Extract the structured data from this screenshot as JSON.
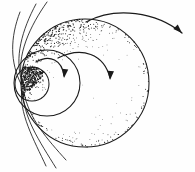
{
  "figure": {
    "title": "Nested stippled spheres with circulation arrows",
    "style": "pen-and-ink stipple drawing",
    "background_color": "#fefefe",
    "ink_color": "#1a1a1a",
    "canvas": {
      "width": 195,
      "height": 172
    }
  },
  "shapes": {
    "outer_sphere": {
      "name": "outer-sphere",
      "cx": 85,
      "cy": 83,
      "r": 64,
      "shading": "stipple dense along upper-left rim and lower-right rim, light interior"
    },
    "middle_sphere": {
      "name": "middle-sphere",
      "cx": 47,
      "cy": 83,
      "r": 33,
      "shading": "stipple dense on upper-left arc"
    },
    "inner_sphere": {
      "name": "inner-sphere",
      "cx": 32,
      "cy": 84,
      "r": 17,
      "shading": "solid dark stipple core"
    },
    "core_spot": {
      "name": "core-spot",
      "cx": 20,
      "cy": 82,
      "r": 8,
      "shading": "darkest ink mass"
    }
  },
  "arrows": [
    {
      "name": "outflow-arrow-outer",
      "label": "outer outflow",
      "path": "M 86 22 C 116 6 156 12 182 33",
      "head_at": [
        182,
        33
      ],
      "head_angle": 44,
      "direction": "right-down"
    },
    {
      "name": "circulation-arrow-middle",
      "label": "middle circulation",
      "path": "M 58 58 C 82 46 104 54 110 78",
      "head_at": [
        110,
        80
      ],
      "head_angle": 95,
      "direction": "down"
    },
    {
      "name": "circulation-arrow-inner",
      "label": "inner circulation",
      "path": "M 36 62 C 50 54 62 60 64 76",
      "head_at": [
        64,
        78
      ],
      "head_angle": 97,
      "direction": "down"
    }
  ],
  "flow_lines": {
    "name": "flow-lines",
    "label": "field lines sweeping from the core",
    "upper": [
      "M 22 80 C 16 56 30 26 47 2",
      "M 22 82 C 14 58 22 30 36 4",
      "M 21 84 C 10 62 10 38 20 12"
    ],
    "lower": [
      "M 22 88 C 18 112 34 140 46 166",
      "M 23 90 C 22 116 40 142 56 168",
      "M 24 92 C 28 118 48 140 66 160"
    ]
  },
  "stipple": {
    "name": "stipple-texture",
    "description": "thousands of ink dots forming tonal gradient on the spheres",
    "seed": 20240517,
    "dot_count": 4200,
    "dot_radius_min": 0.28,
    "dot_radius_max": 0.72
  }
}
